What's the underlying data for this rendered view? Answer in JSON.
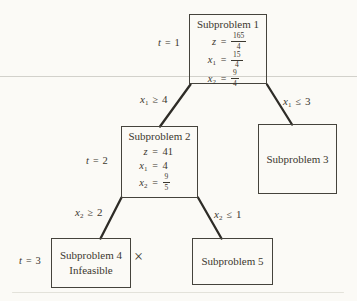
{
  "palette": {
    "paper": "#fbfaf6",
    "ink": "#3b382f",
    "edge_line": "#2e2c27",
    "box_border": "#45433c",
    "scan_artifact": "#d2d1cb"
  },
  "tree": {
    "nodes": {
      "sub1": {
        "title": "Subproblem 1",
        "eq_z": {
          "lhs": "z",
          "rel": "=",
          "num": "165",
          "den": "4"
        },
        "eq_x1": {
          "lhs": "x",
          "sub": "1",
          "rel": "=",
          "num": "15",
          "den": "4"
        },
        "eq_x2": {
          "lhs": "x",
          "sub": "2",
          "rel": "=",
          "num": "9",
          "den": "4"
        }
      },
      "sub2": {
        "title": "Subproblem 2",
        "eq_z": {
          "lhs": "z",
          "rel": "=",
          "val": "41"
        },
        "eq_x1": {
          "lhs": "x",
          "sub": "1",
          "rel": "=",
          "val": "4"
        },
        "eq_x2": {
          "lhs": "x",
          "sub": "2",
          "rel": "=",
          "num": "9",
          "den": "5"
        }
      },
      "sub3": {
        "title": "Subproblem 3"
      },
      "sub4": {
        "title": "Subproblem 4",
        "status": "Infeasible"
      },
      "sub5": {
        "title": "Subproblem 5"
      }
    },
    "iterations": {
      "t1": {
        "lhs": "t",
        "rel": "=",
        "val": "1"
      },
      "t2": {
        "lhs": "t",
        "rel": "=",
        "val": "2"
      },
      "t3": {
        "lhs": "t",
        "rel": "=",
        "val": "3"
      }
    },
    "branches": {
      "x1_ge_4": {
        "lhs": "x",
        "sub": "1",
        "op": "≥",
        "val": "4"
      },
      "x1_le_3": {
        "lhs": "x",
        "sub": "1",
        "op": "≤",
        "val": "3"
      },
      "x2_ge_2": {
        "lhs": "x",
        "sub": "2",
        "op": "≥",
        "val": "2"
      },
      "x2_le_1": {
        "lhs": "x",
        "sub": "2",
        "op": "≤",
        "val": "1"
      }
    },
    "fathom_mark": "×"
  }
}
